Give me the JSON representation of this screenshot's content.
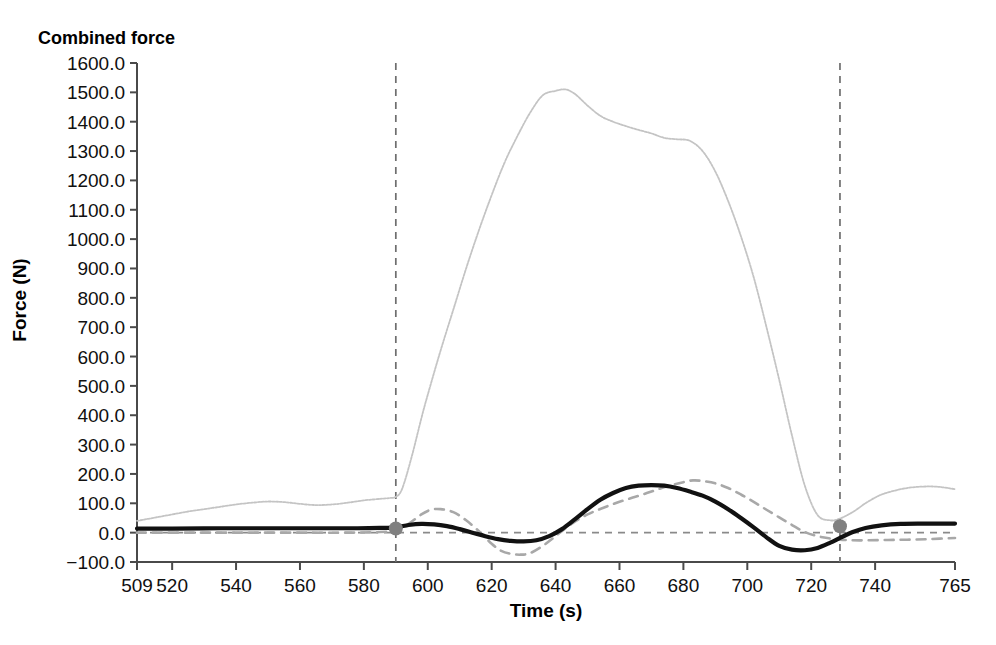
{
  "chart_data": {
    "type": "line",
    "title": "Combined force",
    "xlabel": "Time (s)",
    "ylabel": "Force (N)",
    "xlim": [
      509,
      765
    ],
    "ylim": [
      -100,
      1600
    ],
    "grid": false,
    "legend": "none",
    "xticks": [
      509,
      520,
      540,
      560,
      580,
      600,
      620,
      640,
      660,
      680,
      700,
      720,
      740,
      765
    ],
    "xtick_labels": [
      "509",
      "520",
      "540",
      "560",
      "580",
      "600",
      "620",
      "640",
      "660",
      "680",
      "700",
      "720",
      "740",
      "765"
    ],
    "yticks": [
      -100,
      0,
      100,
      200,
      300,
      400,
      500,
      600,
      700,
      800,
      900,
      1000,
      1100,
      1200,
      1300,
      1400,
      1500,
      1600
    ],
    "ytick_labels": [
      "−100.0",
      "0.0",
      "100.0",
      "200.0",
      "300.0",
      "400.0",
      "500.0",
      "600.0",
      "700.0",
      "800.0",
      "900.0",
      "1000.0",
      "1100.0",
      "1200.0",
      "1300.0",
      "1400.0",
      "1500.0",
      "1600.0"
    ],
    "series": [
      {
        "name": "light-gray-peak-curve",
        "style": "dotted-thin",
        "color": "#c4c4c4",
        "width": 1.8,
        "x": [
          509,
          515,
          520,
          525,
          530,
          535,
          540,
          545,
          550,
          555,
          560,
          565,
          570,
          575,
          580,
          585,
          588,
          590,
          592,
          595,
          598,
          600,
          604,
          608,
          612,
          616,
          620,
          624,
          628,
          632,
          636,
          640,
          643,
          646,
          650,
          654,
          658,
          662,
          666,
          670,
          674,
          678,
          682,
          686,
          690,
          694,
          698,
          702,
          706,
          710,
          714,
          718,
          722,
          726,
          729,
          733,
          737,
          741,
          745,
          750,
          755,
          760,
          765
        ],
        "y": [
          40,
          52,
          62,
          72,
          80,
          88,
          96,
          102,
          106,
          104,
          98,
          94,
          96,
          102,
          110,
          115,
          118,
          122,
          150,
          260,
          390,
          470,
          620,
          760,
          900,
          1030,
          1150,
          1260,
          1350,
          1430,
          1490,
          1505,
          1510,
          1495,
          1455,
          1420,
          1400,
          1385,
          1372,
          1360,
          1345,
          1340,
          1335,
          1300,
          1230,
          1130,
          1010,
          870,
          700,
          520,
          330,
          160,
          60,
          42,
          48,
          70,
          100,
          125,
          140,
          152,
          157,
          156,
          148
        ]
      },
      {
        "name": "gray-dashed-curve",
        "style": "dashed",
        "color": "#a8a8a8",
        "width": 2.6,
        "x": [
          509,
          520,
          540,
          560,
          575,
          585,
          590,
          594,
          598,
          601,
          604,
          608,
          612,
          616,
          620,
          623,
          626,
          629,
          632,
          636,
          640,
          645,
          650,
          655,
          660,
          665,
          670,
          675,
          680,
          683,
          686,
          690,
          694,
          698,
          702,
          706,
          710,
          714,
          718,
          722,
          726,
          729,
          733,
          738,
          744,
          750,
          757,
          765
        ],
        "y": [
          0,
          0,
          0,
          0,
          0,
          2,
          8,
          30,
          62,
          78,
          80,
          70,
          42,
          5,
          -38,
          -62,
          -72,
          -75,
          -70,
          -45,
          -12,
          30,
          62,
          85,
          105,
          122,
          140,
          158,
          172,
          178,
          176,
          168,
          152,
          130,
          105,
          78,
          52,
          26,
          2,
          -12,
          -20,
          -24,
          -26,
          -26,
          -25,
          -24,
          -22,
          -18
        ]
      },
      {
        "name": "black-solid-curve",
        "style": "solid",
        "color": "#111111",
        "width": 4.2,
        "x": [
          509,
          520,
          535,
          550,
          565,
          578,
          585,
          590,
          594,
          598,
          602,
          606,
          610,
          614,
          618,
          622,
          626,
          630,
          634,
          638,
          642,
          646,
          650,
          654,
          658,
          662,
          666,
          670,
          674,
          678,
          682,
          686,
          690,
          694,
          698,
          702,
          706,
          710,
          714,
          718,
          722,
          726,
          729,
          733,
          737,
          742,
          748,
          755,
          765
        ],
        "y": [
          14,
          14,
          15,
          15,
          15,
          15,
          16,
          18,
          26,
          30,
          28,
          22,
          12,
          0,
          -12,
          -22,
          -28,
          -30,
          -26,
          -12,
          12,
          45,
          80,
          112,
          135,
          152,
          160,
          162,
          160,
          152,
          140,
          126,
          106,
          80,
          50,
          18,
          -16,
          -45,
          -58,
          -60,
          -52,
          -34,
          -18,
          2,
          16,
          25,
          30,
          31,
          31
        ]
      }
    ],
    "markers": [
      {
        "name": "marker-start",
        "x": 590,
        "y": 14,
        "color": "#808080",
        "radius": 7
      },
      {
        "name": "marker-end",
        "x": 729,
        "y": 22,
        "color": "#808080",
        "radius": 7
      }
    ],
    "reference_lines": [
      {
        "name": "vline-start",
        "orientation": "vertical",
        "value": 590,
        "color": "#6e6e6e",
        "style": "dashed"
      },
      {
        "name": "vline-end",
        "orientation": "vertical",
        "value": 729,
        "color": "#6e6e6e",
        "style": "dashed"
      },
      {
        "name": "hline-zero",
        "orientation": "horizontal",
        "value": 0,
        "color": "#8a8a8a",
        "style": "dashed"
      }
    ]
  }
}
